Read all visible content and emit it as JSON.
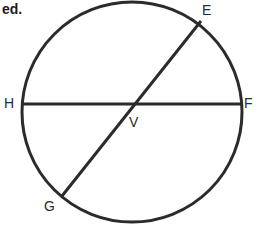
{
  "figure": {
    "kind": "geometry-diagram",
    "cut_off_heading": "ed.",
    "colors": {
      "stroke": "#2b2b2b",
      "label": "#2b2b2b",
      "heading": "#1a1a1a",
      "background": "#ffffff"
    },
    "stroke_width": 3,
    "circle": {
      "name": "circle",
      "cx": 132,
      "cy": 112,
      "r": 110
    },
    "chords": [
      {
        "name": "chord-HF",
        "from_label": "H",
        "to_label": "F",
        "x1": 22,
        "y1": 104,
        "x2": 242,
        "y2": 104
      },
      {
        "name": "chord-EG",
        "from_label": "E",
        "to_label": "G",
        "x1": 201,
        "y1": 21,
        "x2": 62,
        "y2": 196
      }
    ],
    "intersection": {
      "name": "point-V",
      "label": "V",
      "x": 128,
      "y": 105
    },
    "labels": [
      {
        "id": "E",
        "text": "E",
        "x": 202,
        "y": 3
      },
      {
        "id": "F",
        "text": "F",
        "x": 244,
        "y": 96
      },
      {
        "id": "H",
        "text": "H",
        "x": 4,
        "y": 96
      },
      {
        "id": "V",
        "text": "V",
        "x": 129,
        "y": 115
      },
      {
        "id": "G",
        "text": "G",
        "x": 44,
        "y": 199
      }
    ]
  }
}
